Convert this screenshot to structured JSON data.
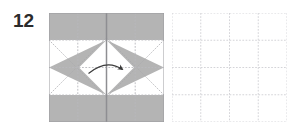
{
  "figure": {
    "kind": "origami-fold-diagram",
    "step_number": "12",
    "panel_count": 2
  },
  "colors": {
    "paper_gray": "#b4b4b4",
    "paper_white": "#ffffff",
    "crease_dotted": "#b9b9bd",
    "crease_solid": "#8e8e92",
    "outline": "#9a9a9e",
    "grid_dotted": "#cfcfd4",
    "arrow": "#3a3a3a",
    "step_text": "#2b2b2b",
    "background": "#ffffff"
  },
  "left_panel": {
    "name": "folded-paper-state",
    "description": "Square sheet, gray side showing as top and bottom bands plus left and right pointing triangles, white diamond in the center",
    "bounds": {
      "x": 49,
      "y": 13,
      "width": 115,
      "height": 109
    },
    "shapes": [
      {
        "name": "top-gray-band",
        "type": "rect",
        "fill": "gray"
      },
      {
        "name": "bottom-gray-band",
        "type": "rect",
        "fill": "gray"
      },
      {
        "name": "left-gray-triangle",
        "type": "triangle",
        "fill": "gray",
        "points_toward": "left"
      },
      {
        "name": "right-gray-triangle",
        "type": "triangle",
        "fill": "gray",
        "points_toward": "right"
      },
      {
        "name": "center-white-diamond",
        "type": "diamond",
        "fill": "white"
      }
    ],
    "creases": {
      "vertical_center_solid": true,
      "vertical_quarter_dotted": 2,
      "horizontal_center_dotted": true,
      "horizontal_quarter_dotted": 2,
      "diagonal_dotted": true
    },
    "arrow": {
      "name": "fold-arrow",
      "type": "curved-arrow",
      "direction": "left-to-right",
      "style": "solid-arrowhead",
      "meaning": "fold flap over to the right"
    }
  },
  "right_panel": {
    "name": "blank-result-grid",
    "description": "Empty square with a 4 by 4 dotted grid, result area for the fold",
    "bounds": {
      "x": 172,
      "y": 13,
      "width": 115,
      "height": 109
    },
    "grid": {
      "columns": 4,
      "rows": 4,
      "line_style": "dotted"
    }
  }
}
